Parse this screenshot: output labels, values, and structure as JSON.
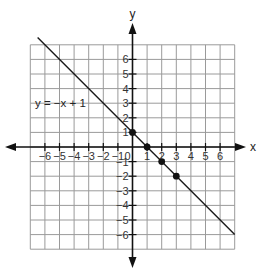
{
  "header": {
    "faint_text": ""
  },
  "chart_data": {
    "type": "line",
    "title": "",
    "xlabel": "x",
    "ylabel": "y",
    "xlim": [
      -7,
      7
    ],
    "ylim": [
      -7,
      7
    ],
    "grid": true,
    "x_ticks": [
      -6,
      -5,
      -4,
      -3,
      -2,
      -1,
      0,
      1,
      2,
      3,
      4,
      5,
      6
    ],
    "y_ticks": [
      -6,
      -5,
      -4,
      -3,
      -2,
      -1,
      1,
      2,
      3,
      4,
      5,
      6
    ],
    "x_tick_labels": [
      "−6",
      "−5",
      "−4",
      "−3",
      "−2",
      "−1",
      "0",
      "1",
      "2",
      "3",
      "4",
      "5",
      "6"
    ],
    "y_tick_labels": [
      "−6",
      "−5",
      "−4",
      "−3",
      "−2",
      "−1",
      "1",
      "2",
      "3",
      "4",
      "5",
      "6"
    ],
    "series": [
      {
        "name": "y = −x + 1",
        "equation": "y = -x + 1",
        "slope": -1,
        "intercept": 1,
        "line_x_range": [
          -6.5,
          7
        ],
        "points": [
          {
            "x": 0,
            "y": 1
          },
          {
            "x": 1,
            "y": 0
          },
          {
            "x": 2,
            "y": -1
          },
          {
            "x": 3,
            "y": -2
          }
        ]
      }
    ],
    "annotations": [
      {
        "text": "y = −x + 1",
        "x": -6,
        "y": 3
      }
    ]
  },
  "labels": {
    "x_axis": "x",
    "y_axis": "y",
    "equation": "y = −x + 1"
  }
}
